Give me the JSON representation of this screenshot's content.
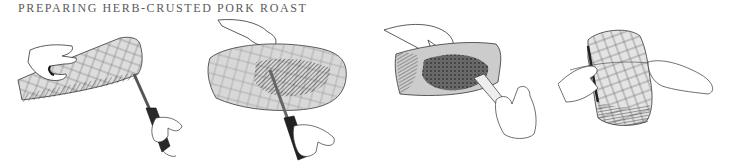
{
  "header": {
    "title": "Preparing Herb-Crusted Pork Roast"
  },
  "illustrations": [
    {
      "step": 1,
      "description": "Hand holding pork roast while knife is inserted into the end to make a pocket"
    },
    {
      "step": 2,
      "description": "Hand holding open pocket in roast while knife cuts inside"
    },
    {
      "step": 3,
      "description": "Hand holding roast open while spatula spreads herb paste inside pocket"
    },
    {
      "step": 4,
      "description": "Two hands tying the roast with kitchen twine"
    }
  ],
  "colors": {
    "title": "#5a5a5a",
    "ink": "#222222",
    "background": "#ffffff"
  }
}
